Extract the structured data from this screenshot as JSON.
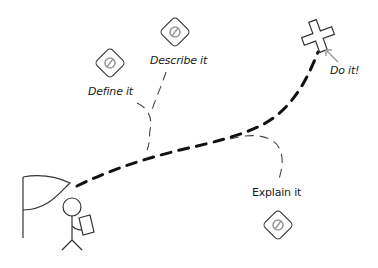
{
  "diagram": {
    "type": "journey-map",
    "start": {
      "icon": "flag-icon",
      "figure": "stick-figure-with-map"
    },
    "goal": {
      "icon": "x-mark-icon",
      "label": "Do it!"
    },
    "steps": [
      {
        "label": "Define it",
        "icon": "no-entry-sign-icon"
      },
      {
        "label": "Describe it",
        "icon": "no-entry-sign-icon"
      },
      {
        "label": "Explain it",
        "icon": "no-entry-sign-icon"
      }
    ],
    "colors": {
      "path": "#111111",
      "branch": "#444444",
      "sign_outline": "#333333",
      "sign_symbol": "#9a9a9a",
      "arrow": "#9a9a9a"
    }
  }
}
